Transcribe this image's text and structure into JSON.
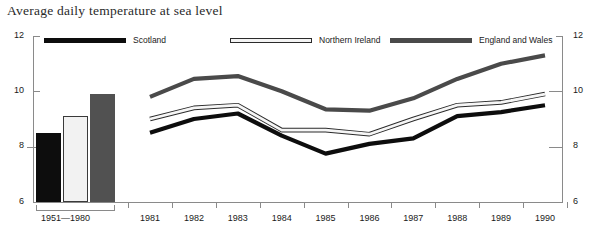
{
  "title": "Average daily temperature at sea level",
  "legend": {
    "items": [
      {
        "label": "Scotland",
        "color": "#0d0d0d",
        "style": "solid-black"
      },
      {
        "label": "Northern Ireland",
        "color": "#f4f4f4",
        "style": "outlined-white"
      },
      {
        "label": "England and Wales",
        "color": "#4a4a4a",
        "style": "solid-gray"
      }
    ]
  },
  "axis": {
    "y_ticks": [
      "12",
      "10",
      "8",
      "6"
    ],
    "y_ticks_right": [
      "12",
      "10",
      "8",
      "6"
    ],
    "baseline_group_label": "1951—1980",
    "x_labels": [
      "1981",
      "1982",
      "1983",
      "1984",
      "1985",
      "1986",
      "1987",
      "1988",
      "1989",
      "1990"
    ]
  },
  "chart_data": {
    "type": "line",
    "title": "Average daily temperature at sea level",
    "xlabel": "",
    "ylabel": "",
    "ylim": [
      6,
      12
    ],
    "ytick_values": [
      6,
      8,
      10,
      12
    ],
    "grid": false,
    "legend_position": "top",
    "baseline": {
      "category": "1951—1980",
      "type": "bar",
      "series": [
        {
          "name": "Scotland",
          "value": 8.5,
          "color": "#0d0d0d"
        },
        {
          "name": "Northern Ireland",
          "value": 9.1,
          "color": "#f2f2f2"
        },
        {
          "name": "England and Wales",
          "value": 9.9,
          "color": "#515151"
        }
      ]
    },
    "categories": [
      "1981",
      "1982",
      "1983",
      "1984",
      "1985",
      "1986",
      "1987",
      "1988",
      "1989",
      "1990"
    ],
    "series": [
      {
        "name": "Scotland",
        "color": "#0d0d0d",
        "values": [
          8.5,
          9.0,
          9.2,
          8.4,
          7.75,
          8.1,
          8.3,
          9.1,
          9.25,
          9.5
        ]
      },
      {
        "name": "Northern Ireland",
        "color": "#f4f4f4",
        "values": [
          9.0,
          9.4,
          9.5,
          8.6,
          8.6,
          8.45,
          9.0,
          9.5,
          9.6,
          9.9
        ]
      },
      {
        "name": "England and Wales",
        "color": "#4a4a4a",
        "values": [
          9.8,
          10.45,
          10.55,
          10.0,
          9.35,
          9.3,
          9.75,
          10.45,
          11.0,
          11.3
        ]
      }
    ]
  }
}
